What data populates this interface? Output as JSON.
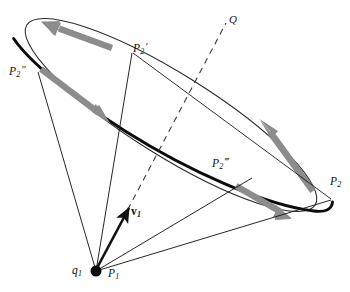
{
  "figure": {
    "background_color": "#ffffff",
    "stroke_color": "#111111",
    "arrow_color": "#8a8a8a",
    "labels": {
      "q1": {
        "base": "q",
        "sub": "1",
        "prime": ""
      },
      "p1": {
        "base": "P",
        "sub": "1",
        "prime": ""
      },
      "p2": {
        "base": "P",
        "sub": "2",
        "prime": ""
      },
      "p2_prime": {
        "base": "P",
        "sub": "2",
        "prime": "′"
      },
      "p2_double_prime": {
        "base": "P",
        "sub": "2",
        "prime": "″"
      },
      "p2_triple_prime": {
        "base": "P",
        "sub": "2",
        "prime": "‴"
      },
      "v1": {
        "base": "v",
        "sub": "1",
        "prime": ""
      },
      "q": {
        "base": "Q",
        "sub": "",
        "prime": ""
      }
    },
    "geometry": {
      "apex": {
        "x": 96,
        "y": 271,
        "dot_radius": 5.5
      },
      "ellipse": {
        "center_x": 171,
        "center_y": 115,
        "semi_major": 170,
        "semi_minor": 41,
        "rotation_deg": 32
      },
      "points": {
        "p2_prime": {
          "x": 133,
          "y": 52
        },
        "p2_double_prime": {
          "x": 38,
          "y": 72
        },
        "p2_triple_prime": {
          "x": 253,
          "y": 178
        },
        "p2": {
          "x": 330,
          "y": 197
        },
        "q_end": {
          "x": 226,
          "y": 22
        }
      },
      "arrows": [
        {
          "name": "tangent-arrow-top-left",
          "x1": 113,
          "y1": 45,
          "x2": 44,
          "y2": 22
        },
        {
          "name": "tangent-arrow-left-down",
          "x1": 42,
          "y1": 71,
          "x2": 105,
          "y2": 121
        },
        {
          "name": "tangent-arrow-right-up",
          "x1": 313,
          "y1": 190,
          "x2": 262,
          "y2": 122
        },
        {
          "name": "tangent-arrow-bottom-right",
          "x1": 237,
          "y1": 186,
          "x2": 288,
          "y2": 216
        }
      ]
    }
  }
}
